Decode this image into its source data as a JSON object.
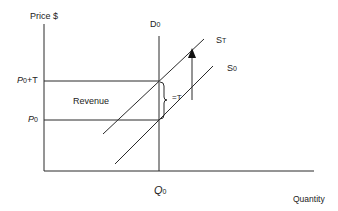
{
  "diagram": {
    "type": "supply-demand-tax",
    "axes": {
      "y_label": "Price $",
      "x_label": "Quantity"
    },
    "curves": {
      "demand": {
        "label": "D",
        "sub": "0"
      },
      "supply_taxed": {
        "label": "S",
        "sub": "T"
      },
      "supply_original": {
        "label": "S",
        "sub": "0"
      }
    },
    "price_levels": {
      "taxed": {
        "label": "P",
        "sub": "0",
        "suffix": "+T"
      },
      "original": {
        "label": "P",
        "sub": "0"
      }
    },
    "quantity_levels": {
      "original": {
        "label": "Q",
        "sub": "0"
      }
    },
    "annotations": {
      "revenue_area": "Revenue",
      "tax_brace": "=T"
    },
    "colors": {
      "line": "#2a2a2a",
      "background": "#ffffff"
    }
  }
}
